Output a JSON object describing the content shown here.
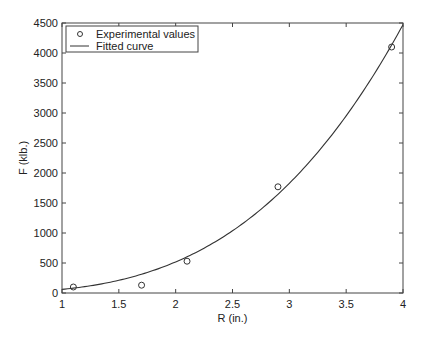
{
  "chart_data": {
    "type": "scatter",
    "title": "",
    "xlabel": "R (in.)",
    "ylabel": "F (klb.)",
    "xlim": [
      1,
      4
    ],
    "ylim": [
      0,
      4500
    ],
    "xticks": [
      1,
      1.5,
      2,
      2.5,
      3,
      3.5,
      4
    ],
    "xtick_labels": [
      "1",
      "1.5",
      "2",
      "2.5",
      "3",
      "3.5",
      "4"
    ],
    "yticks": [
      0,
      500,
      1000,
      1500,
      2000,
      2500,
      3000,
      3500,
      4000,
      4500
    ],
    "ytick_labels": [
      "0",
      "500",
      "1000",
      "1500",
      "2000",
      "2500",
      "3000",
      "3500",
      "4000",
      "4500"
    ],
    "grid": false,
    "legend_position": "upper left",
    "series": [
      {
        "name": "Experimental values",
        "kind": "scatter",
        "marker": "open-circle",
        "x": [
          1.1,
          1.7,
          2.1,
          2.9,
          3.9
        ],
        "y": [
          100,
          130,
          530,
          1770,
          4100
        ]
      },
      {
        "name": "Fitted curve",
        "kind": "line",
        "model": "power",
        "a": 60,
        "n": 3.11,
        "x": [
          1.0,
          1.5,
          2.0,
          2.5,
          3.0,
          3.5,
          4.0
        ],
        "y": [
          60,
          212,
          518,
          1040,
          1830,
          2960,
          4500
        ]
      }
    ]
  },
  "colors": {
    "axes": "#444444",
    "line": "#333333",
    "marker": "#333333",
    "background": "#ffffff"
  }
}
